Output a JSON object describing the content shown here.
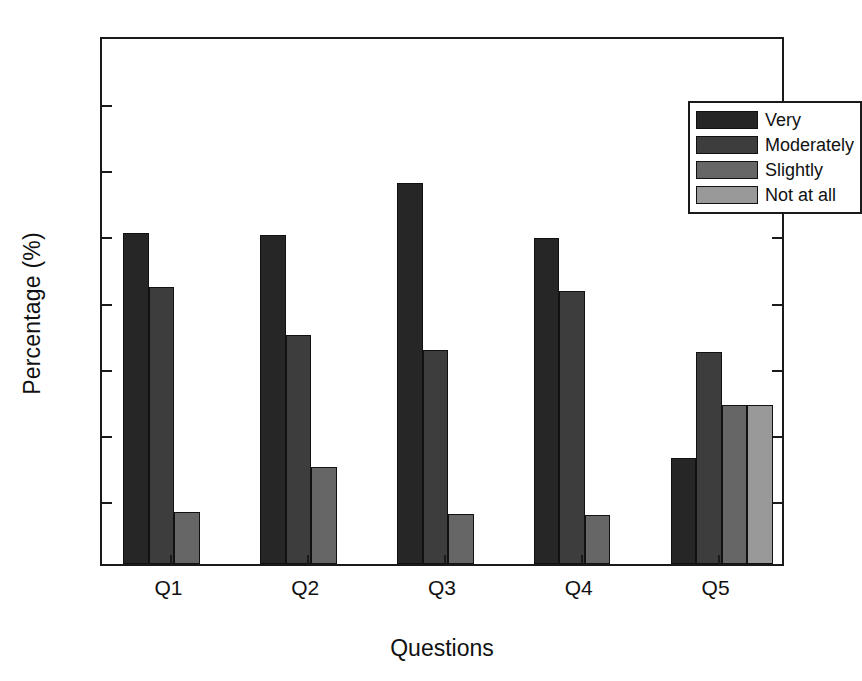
{
  "chart_data": {
    "type": "bar",
    "title": "",
    "subtitle": "",
    "xlabel": "Questions",
    "ylabel": "Percentage (%)",
    "categories": [
      "Q1",
      "Q2",
      "Q3",
      "Q4",
      "Q5"
    ],
    "ylim": [
      0,
      80
    ],
    "yticks": [
      0,
      10,
      20,
      30,
      40,
      50,
      60,
      70,
      80
    ],
    "ytick_labels": [
      "0",
      "10",
      "20",
      "30",
      "40",
      "50",
      "60",
      "70",
      "80"
    ],
    "grid": false,
    "legend_position": "top-right",
    "series": [
      {
        "name": "Very",
        "color": "#262626",
        "values": [
          50.0,
          49.7,
          57.6,
          49.3,
          16.0
        ]
      },
      {
        "name": "Moderately",
        "color": "#3d3d3d",
        "values": [
          41.9,
          34.6,
          32.4,
          41.3,
          32.1
        ]
      },
      {
        "name": "Slightly",
        "color": "#666666",
        "values": [
          7.9,
          14.7,
          7.5,
          7.4,
          24.1
        ]
      },
      {
        "name": "Not at all",
        "color": "#999999",
        "values": [
          0,
          0,
          0,
          0,
          24.1
        ]
      }
    ]
  },
  "legend": {
    "items": [
      {
        "label": "Very",
        "color": "#262626"
      },
      {
        "label": "Moderately",
        "color": "#3d3d3d"
      },
      {
        "label": "Slightly",
        "color": "#666666"
      },
      {
        "label": "Not at all",
        "color": "#999999"
      }
    ]
  },
  "axes": {
    "y_label": "Percentage (%)",
    "x_label": "Questions"
  }
}
